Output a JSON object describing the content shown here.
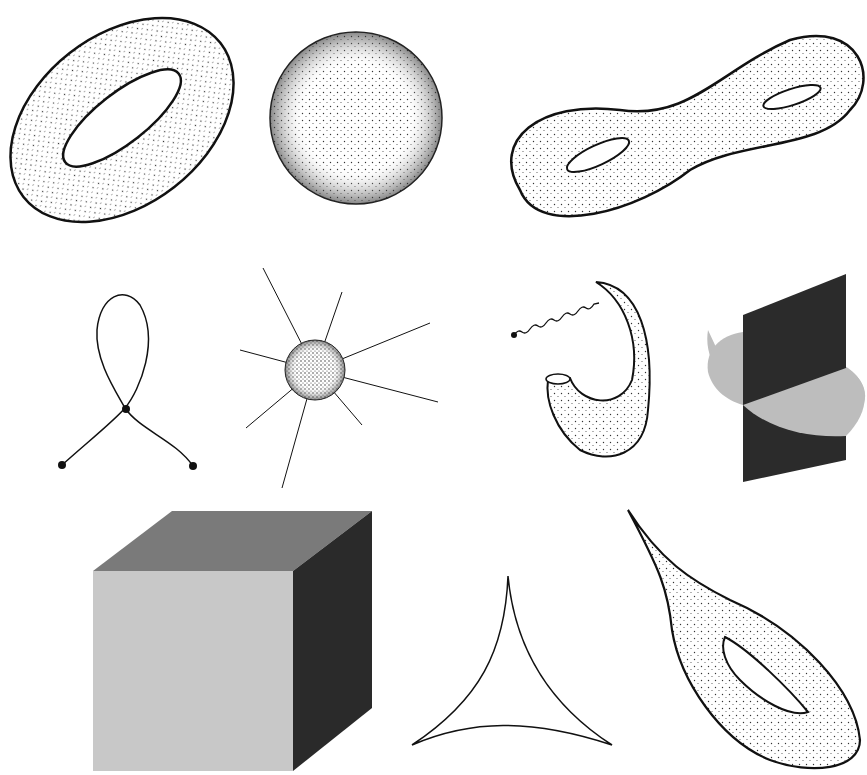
{
  "figure": {
    "background": "#ffffff",
    "ink": "#111111",
    "stipple_fill": "#f4f4f4",
    "cube": {
      "top": "#7a7a7a",
      "front": "#c8c8c8",
      "side": "#2a2a2a"
    },
    "planes": {
      "vertical": "#2b2b2b",
      "disk": "#bdbdbd"
    }
  },
  "shapes": [
    {
      "id": "torus",
      "row": 1,
      "col": 1,
      "label": "torus"
    },
    {
      "id": "sphere",
      "row": 1,
      "col": 2,
      "label": "sphere"
    },
    {
      "id": "double-torus",
      "row": 1,
      "col": 3,
      "label": "double torus"
    },
    {
      "id": "figure-eight-curve",
      "row": 2,
      "col": 1,
      "label": "self-intersecting curve with endpoints"
    },
    {
      "id": "spiky-ball",
      "row": 2,
      "col": 2,
      "label": "ball with protruding lines"
    },
    {
      "id": "horn-with-wiggle",
      "row": 2,
      "col": 3,
      "label": "horn surface with wavy tail"
    },
    {
      "id": "intersecting-planes",
      "row": 2,
      "col": 4,
      "label": "intersecting planes"
    },
    {
      "id": "cube",
      "row": 3,
      "col": 1,
      "label": "cube"
    },
    {
      "id": "deltoid",
      "row": 3,
      "col": 2,
      "label": "three-cusp curve"
    },
    {
      "id": "pinched-torus",
      "row": 3,
      "col": 3,
      "label": "torus with spike"
    }
  ]
}
